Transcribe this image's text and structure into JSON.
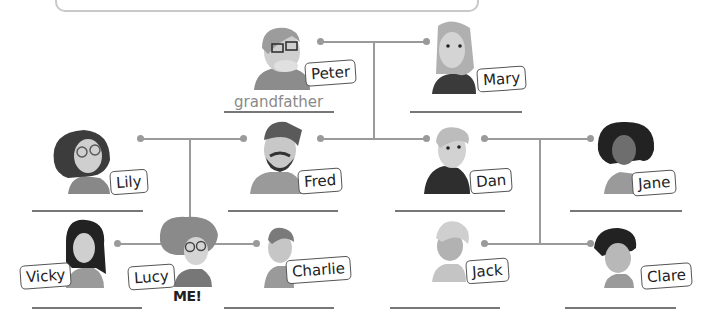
{
  "title_box": {
    "text": ""
  },
  "people": {
    "peter": {
      "name": "Peter",
      "answer": "grandfather"
    },
    "mary": {
      "name": "Mary",
      "answer": ""
    },
    "lily": {
      "name": "Lily",
      "answer": ""
    },
    "fred": {
      "name": "Fred",
      "answer": ""
    },
    "dan": {
      "name": "Dan",
      "answer": ""
    },
    "jane": {
      "name": "Jane",
      "answer": ""
    },
    "vicky": {
      "name": "Vicky",
      "answer": ""
    },
    "lucy": {
      "name": "Lucy",
      "answer": "",
      "tag": "ME!"
    },
    "charlie": {
      "name": "Charlie",
      "answer": ""
    },
    "jack": {
      "name": "Jack",
      "answer": ""
    },
    "clare": {
      "name": "Clare",
      "answer": ""
    }
  },
  "colors": {
    "line": "#9a9a9a",
    "label_border": "#555555",
    "answer_text": "#8a8a8a"
  }
}
